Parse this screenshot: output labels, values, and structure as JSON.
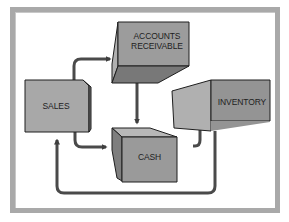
{
  "diagram": {
    "title": "",
    "nodes": [
      {
        "id": "accounts_receivable",
        "label_line1": "ACCOUNTS",
        "label_line2": "RECEIVABLE"
      },
      {
        "id": "sales",
        "label": "SALES"
      },
      {
        "id": "cash",
        "label": "CASH"
      },
      {
        "id": "inventory",
        "label": "INVENTORY"
      }
    ],
    "edges": [
      {
        "from": "sales",
        "to": "accounts_receivable"
      },
      {
        "from": "accounts_receivable",
        "to": "cash"
      },
      {
        "from": "sales",
        "to": "cash"
      },
      {
        "from": "cash",
        "to": "inventory"
      },
      {
        "from": "inventory",
        "to": "sales"
      }
    ],
    "colors": {
      "frame": "#a9a9a9",
      "box_front": "#9a9a9a",
      "box_side_light": "#b4b4b4",
      "box_side_dark": "#7a7a7a",
      "arrow": "#4a4a4a",
      "text": "#1e1e1e"
    }
  }
}
